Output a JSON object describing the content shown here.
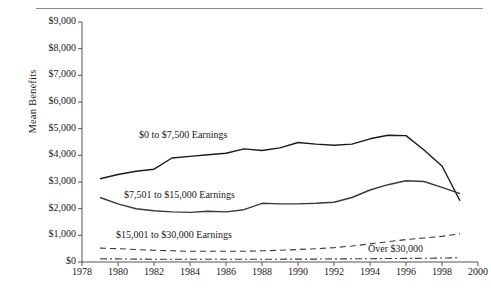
{
  "axes": {
    "ylabel": "Mean Benefits",
    "yticks": [
      "$0",
      "$1,000",
      "$2,000",
      "$3,000",
      "$4,000",
      "$5,000",
      "$6,000",
      "$7,000",
      "$8,000",
      "$9,000"
    ],
    "xticks": [
      "1978",
      "1980",
      "1982",
      "1984",
      "1986",
      "1988",
      "1990",
      "1992",
      "1994",
      "1996",
      "1998",
      "2000"
    ]
  },
  "labels": {
    "s1": "$0 to $7,500 Earnings",
    "s2": "$7,501 to $15,000 Earnings",
    "s3": "$15,001 to $30,000 Earnings",
    "s4": "Over $30,000"
  },
  "chart_data": {
    "type": "line",
    "title": "",
    "xlabel": "",
    "ylabel": "Mean Benefits",
    "xlim": [
      1978,
      2000
    ],
    "ylim": [
      0,
      9000
    ],
    "grid": false,
    "legend": "inline annotations",
    "x": [
      1979,
      1980,
      1981,
      1982,
      1983,
      1984,
      1985,
      1986,
      1987,
      1988,
      1989,
      1990,
      1991,
      1992,
      1993,
      1994,
      1995,
      1996,
      1997,
      1998,
      1999
    ],
    "series": [
      {
        "name": "$0 to $7,500 Earnings",
        "style": "solid",
        "color": "#1a1a1a",
        "values": [
          3120,
          3280,
          3400,
          3480,
          3900,
          3960,
          4020,
          4080,
          4240,
          4180,
          4280,
          4480,
          4420,
          4380,
          4420,
          4620,
          4750,
          4740,
          4200,
          3600,
          2300
        ]
      },
      {
        "name": "$7,501 to $15,000 Earnings",
        "style": "solid",
        "color": "#3a3a3a",
        "values": [
          2420,
          2180,
          2000,
          1920,
          1880,
          1860,
          1900,
          1880,
          1960,
          2200,
          2180,
          2180,
          2200,
          2240,
          2420,
          2700,
          2900,
          3050,
          3020,
          2800,
          2560
        ]
      },
      {
        "name": "$15,001 to $30,000 Earnings",
        "style": "dashed",
        "color": "#3a3a3a",
        "values": [
          520,
          500,
          470,
          440,
          420,
          400,
          400,
          400,
          400,
          420,
          440,
          470,
          500,
          540,
          600,
          680,
          760,
          840,
          900,
          960,
          1060
        ]
      },
      {
        "name": "Over $30,000",
        "style": "dash-dot",
        "color": "#3a3a3a",
        "values": [
          120,
          115,
          110,
          105,
          100,
          100,
          100,
          100,
          100,
          105,
          105,
          110,
          110,
          115,
          120,
          125,
          130,
          135,
          140,
          150,
          160
        ]
      }
    ]
  }
}
